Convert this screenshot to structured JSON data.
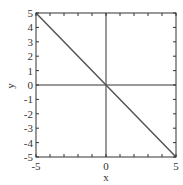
{
  "chart_data": {
    "type": "line",
    "title": "",
    "xlabel": "x",
    "ylabel": "y",
    "xlim": [
      -5,
      5
    ],
    "ylim": [
      -5,
      5
    ],
    "grid": false,
    "legend": null,
    "reference_lines": [
      {
        "orientation": "vertical",
        "x": 0
      },
      {
        "orientation": "horizontal",
        "y": 0
      }
    ],
    "x_ticks": [
      -5,
      0,
      5
    ],
    "x_tick_labels": [
      "-5",
      "0",
      "5"
    ],
    "y_ticks": [
      -5,
      -4,
      -3,
      -2,
      -1,
      0,
      1,
      2,
      3,
      4,
      5
    ],
    "y_tick_labels": [
      "-5",
      "-4",
      "-3",
      "-2",
      "-1",
      "0",
      "1",
      "2",
      "3",
      "4",
      "5"
    ],
    "series": [
      {
        "name": "y = -x",
        "x": [
          -5,
          0,
          5
        ],
        "y": [
          5,
          0,
          -5
        ],
        "color": "#555555"
      }
    ]
  },
  "plot": {
    "axis_color": "#333333",
    "line_color": "#555555"
  }
}
